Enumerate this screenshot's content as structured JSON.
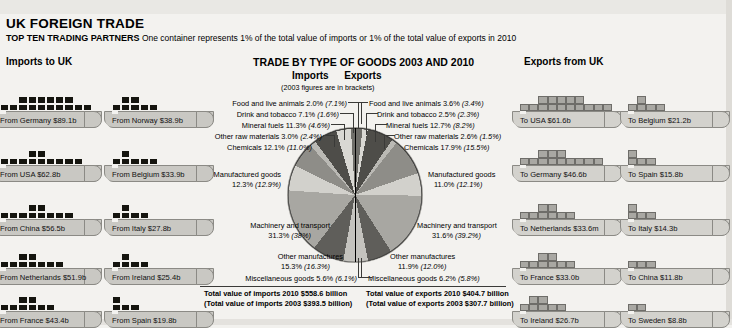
{
  "header": {
    "title": "UK FOREIGN TRADE",
    "subtitle_bold": "TOP TEN TRADING PARTNERS",
    "subtitle_rest": "One container represents 1% of the total value of imports or 1% of the total value of exports in 2010",
    "imports_heading": "Imports to UK",
    "exports_heading": "Exports from UK",
    "pie_heading": "TRADE BY TYPE OF GOODS 2003 AND 2010",
    "pie_sub_imports": "Imports",
    "pie_sub_exports": "Exports",
    "pie_note": "(2003 figures are in brackets)"
  },
  "imports_ships": [
    {
      "label": "From Germany $89.1b",
      "value": 89.1,
      "containers": 16
    },
    {
      "label": "From Norway $38.9b",
      "value": 38.9,
      "containers": 7
    },
    {
      "label": "From USA $62.8b",
      "value": 62.8,
      "containers": 11
    },
    {
      "label": "From Belgium $33.9b",
      "value": 33.9,
      "containers": 6
    },
    {
      "label": "From China $56.5b",
      "value": 56.5,
      "containers": 10
    },
    {
      "label": "From Italy $27.8b",
      "value": 27.8,
      "containers": 5
    },
    {
      "label": "From Netherlands $51.9b",
      "value": 51.9,
      "containers": 9
    },
    {
      "label": "From Ireland $25.4b",
      "value": 25.4,
      "containers": 5
    },
    {
      "label": "From France $43.4b",
      "value": 43.4,
      "containers": 8
    },
    {
      "label": "From Spain $19.8b",
      "value": 19.8,
      "containers": 4
    }
  ],
  "exports_ships": [
    {
      "label": "To USA $61.6b",
      "value": 61.6,
      "containers": 15
    },
    {
      "label": "To Belgium $21.2b",
      "value": 21.2,
      "containers": 5
    },
    {
      "label": "To Germany $46.6b",
      "value": 46.6,
      "containers": 12
    },
    {
      "label": "To Spain $15.8b",
      "value": 15.8,
      "containers": 4
    },
    {
      "label": "To Netherlands $33.6m",
      "value": 33.6,
      "containers": 8
    },
    {
      "label": "To Italy $14.3b",
      "value": 14.3,
      "containers": 4
    },
    {
      "label": "To France $33.0b",
      "value": 33.0,
      "containers": 8
    },
    {
      "label": "To China $11.8b",
      "value": 11.8,
      "containers": 3
    },
    {
      "label": "To Ireland $26.7b",
      "value": 26.7,
      "containers": 7
    },
    {
      "label": "To Sweden $8.8b",
      "value": 8.8,
      "containers": 2
    }
  ],
  "totals": {
    "imports_2010": "Total value of imports 2010 $558.6 billion",
    "imports_2003": "(Total value of imports 2003 $393.5 billion)",
    "exports_2010": "Total value of exports 2010 $404.7 billion",
    "exports_2003": "(Total value of exports 2003 $307.7 billion)"
  },
  "chart_data": {
    "type": "pie",
    "title": "TRADE BY TYPE OF GOODS 2003 AND 2010",
    "note": "(2003 figures are in brackets)",
    "halves": [
      "Imports",
      "Exports"
    ],
    "categories": [
      "Food and live animals",
      "Drink and tobacco",
      "Mineral fuels",
      "Other raw materials",
      "Chemicals",
      "Manufactured goods",
      "Machinery and transport",
      "Other manufactures",
      "Miscellaneous goods"
    ],
    "series": [
      {
        "name": "Imports 2010",
        "values": [
          2.0,
          7.1,
          11.3,
          3.0,
          12.1,
          12.3,
          31.3,
          15.3,
          5.6
        ]
      },
      {
        "name": "Imports 2003",
        "values": [
          7.1,
          1.6,
          4.6,
          2.4,
          11.0,
          12.9,
          38.0,
          16.3,
          6.1
        ]
      },
      {
        "name": "Exports 2010",
        "values": [
          3.6,
          2.5,
          12.7,
          2.6,
          17.9,
          11.0,
          31.6,
          11.9,
          6.2
        ]
      },
      {
        "name": "Exports 2003",
        "values": [
          3.4,
          2.3,
          8.2,
          1.5,
          15.5,
          12.1,
          39.2,
          12.0,
          5.8
        ]
      }
    ],
    "imports_labels": [
      {
        "name": "Food and live animals",
        "current": "2.0%",
        "previous": "(7.1%)"
      },
      {
        "name": "Drink and tobacco",
        "current": "7.1%",
        "previous": "(1.6%)"
      },
      {
        "name": "Mineral fuels",
        "current": "11.3%",
        "previous": "(4.6%)"
      },
      {
        "name": "Other raw materials",
        "current": "3.0%",
        "previous": "(2.4%)"
      },
      {
        "name": "Chemicals",
        "current": "12.1%",
        "previous": "(11.0%)"
      },
      {
        "name": "Manufactured goods",
        "current": "12.3%",
        "previous": "(12.9%)"
      },
      {
        "name": "Machinery and transport",
        "current": "31.3%",
        "previous": "(38%)"
      },
      {
        "name": "Other manufactures",
        "current": "15.3%",
        "previous": "(16.3%)"
      },
      {
        "name": "Miscellaneous goods",
        "current": "5.6%",
        "previous": "(6.1%)"
      }
    ],
    "exports_labels": [
      {
        "name": "Food and live animals",
        "current": "3.6%",
        "previous": "(3.4%)"
      },
      {
        "name": "Drink and tobacco",
        "current": "2.5%",
        "previous": "(2.3%)"
      },
      {
        "name": "Mineral fuels",
        "current": "12.7%",
        "previous": "(8.2%)"
      },
      {
        "name": "Other raw materials",
        "current": "2.6%",
        "previous": "(1.5%)"
      },
      {
        "name": "Chemicals",
        "current": "17.9%",
        "previous": "(15.5%)"
      },
      {
        "name": "Manufactured goods",
        "current": "11.0%",
        "previous": "(12.1%)"
      },
      {
        "name": "Machinery and transport",
        "current": "31.6%",
        "previous": "(39.2%)"
      },
      {
        "name": "Other manufactures",
        "current": "11.9%",
        "previous": "(12.0%)"
      },
      {
        "name": "Miscellaneous goods",
        "current": "6.2%",
        "previous": "(5.8%)"
      }
    ]
  },
  "label_text": {
    "imp": [
      "Food and live animals 2.0% (7.1%)",
      "Drink and tobacco 7.1% (1.6%)",
      "Mineral fuels 11.3% (4.6%)",
      "Other raw materials 3.0% (2.4%)",
      "Chemicals 12.1% (11.0%)",
      "Manufactured goods",
      "12.3% (12.9%)",
      "Machinery and transport",
      "31.3% (38%)",
      "Other manufactures",
      "15.3% (16.3%)",
      "Miscellaneous goods 5.6% (6.1%)"
    ],
    "exp": [
      "Food and live animals 3.6% (3.4%)",
      "Drink and tobacco 2.5% (2.3%)",
      "Mineral fuels 12.7% (8.2%)",
      "Other raw materials 2.6% (1.5%)",
      "Chemicals 17.9% (15.5%)",
      "Manufactured goods",
      "11.0% (12.1%)",
      "Machinery and transport",
      "31.6% (39.2%)",
      "Other manufactures",
      "11.9% (12.0%)",
      "Miscellaneous goods 6.2% (5.8%)"
    ]
  }
}
